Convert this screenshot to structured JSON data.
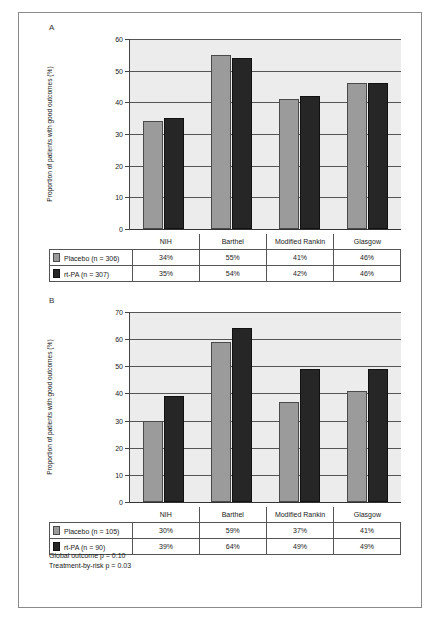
{
  "figure": {
    "panels": [
      {
        "letter": "A",
        "ylabel": "Proportion of patients with good outcomes (%)",
        "yticks": [
          "0",
          "10",
          "20",
          "30",
          "40",
          "50",
          "60"
        ],
        "ymax": 60,
        "categories": [
          "NIH",
          "Barthel",
          "Modified Rankin",
          "Glasgow"
        ],
        "series": [
          {
            "name": "Placebo",
            "n_label": "Placebo (n = 306)",
            "color": "#9b9b9b",
            "values": [
              34,
              55,
              41,
              46
            ],
            "labels": [
              "34%",
              "55%",
              "41%",
              "46%"
            ]
          },
          {
            "name": "rt-PA",
            "n_label": "rt-PA (n = 307)",
            "color": "#262626",
            "values": [
              35,
              54,
              42,
              46
            ],
            "labels": [
              "35%",
              "54%",
              "42%",
              "46%"
            ]
          }
        ]
      },
      {
        "letter": "B",
        "ylabel": "Proportion of patients with good outcomes (%)",
        "yticks": [
          "0",
          "10",
          "20",
          "30",
          "40",
          "50",
          "60",
          "70"
        ],
        "ymax": 70,
        "categories": [
          "NIH",
          "Barthel",
          "Modified Rankin",
          "Glasgow"
        ],
        "series": [
          {
            "name": "Placebo",
            "n_label": "Placebo (n = 105)",
            "color": "#9b9b9b",
            "values": [
              30,
              59,
              37,
              41
            ],
            "labels": [
              "30%",
              "59%",
              "37%",
              "41%"
            ]
          },
          {
            "name": "rt-PA",
            "n_label": "rt-PA (n = 90)",
            "color": "#262626",
            "values": [
              39,
              64,
              49,
              49
            ],
            "labels": [
              "39%",
              "64%",
              "49%",
              "49%"
            ]
          }
        ]
      }
    ],
    "footnotes": [
      "Global outcome p = 0.10",
      "Treatment-by-risk p = 0.03"
    ]
  },
  "chart_data": [
    {
      "type": "bar",
      "panel": "A",
      "title": "",
      "xlabel": "",
      "ylabel": "Proportion of patients with good outcomes (%)",
      "categories": [
        "NIH",
        "Barthel",
        "Modified Rankin",
        "Glasgow"
      ],
      "series": [
        {
          "name": "Placebo (n = 306)",
          "values": [
            34,
            55,
            41,
            46
          ],
          "color": "#9b9b9b"
        },
        {
          "name": "rt-PA (n = 307)",
          "values": [
            35,
            54,
            42,
            46
          ],
          "color": "#262626"
        }
      ],
      "ylim": [
        0,
        60
      ],
      "yticks": [
        0,
        10,
        20,
        30,
        40,
        50,
        60
      ],
      "grid": true,
      "legend_position": "table-below"
    },
    {
      "type": "bar",
      "panel": "B",
      "title": "",
      "xlabel": "",
      "ylabel": "Proportion of patients with good outcomes (%)",
      "categories": [
        "NIH",
        "Barthel",
        "Modified Rankin",
        "Glasgow"
      ],
      "series": [
        {
          "name": "Placebo (n = 105)",
          "values": [
            30,
            59,
            37,
            41
          ],
          "color": "#9b9b9b"
        },
        {
          "name": "rt-PA (n = 90)",
          "values": [
            39,
            64,
            49,
            49
          ],
          "color": "#262626"
        }
      ],
      "ylim": [
        0,
        70
      ],
      "yticks": [
        0,
        10,
        20,
        30,
        40,
        50,
        60,
        70
      ],
      "grid": true,
      "legend_position": "table-below",
      "annotations": [
        "Global outcome p = 0.10",
        "Treatment-by-risk p = 0.03"
      ]
    }
  ]
}
